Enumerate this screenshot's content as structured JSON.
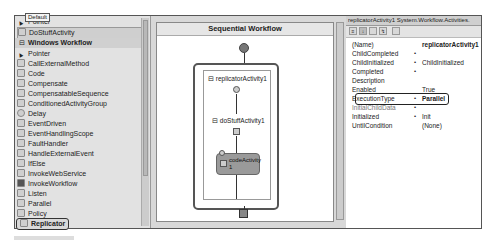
{
  "toolbox": {
    "tooltip": "Default",
    "top_items": [
      {
        "label": "Pointer",
        "icon": "pointer-arrow-icon"
      },
      {
        "label": "DoStuffActivity",
        "icon": "activity-gear-icon",
        "selected": true
      }
    ],
    "section_header": "Windows Workflow",
    "items": [
      {
        "label": "Pointer",
        "icon": "pointer-arrow-icon"
      },
      {
        "label": "CallExternalMethod",
        "icon": "call-external-method-icon"
      },
      {
        "label": "Code",
        "icon": "code-icon"
      },
      {
        "label": "Compensate",
        "icon": "compensate-icon"
      },
      {
        "label": "CompensatableSequence",
        "icon": "compensatable-sequence-icon"
      },
      {
        "label": "ConditionedActivityGroup",
        "icon": "conditioned-activity-group-icon"
      },
      {
        "label": "Delay",
        "icon": "delay-clock-icon"
      },
      {
        "label": "EventDriven",
        "icon": "event-driven-icon"
      },
      {
        "label": "EventHandlingScope",
        "icon": "event-handling-scope-icon"
      },
      {
        "label": "FaultHandler",
        "icon": "fault-handler-icon"
      },
      {
        "label": "HandleExternalEvent",
        "icon": "handle-external-event-icon"
      },
      {
        "label": "IfElse",
        "icon": "ifelse-icon"
      },
      {
        "label": "InvokeWebService",
        "icon": "invoke-web-service-icon"
      },
      {
        "label": "InvokeWorkflow",
        "icon": "invoke-workflow-icon"
      },
      {
        "label": "Listen",
        "icon": "listen-icon"
      },
      {
        "label": "Parallel",
        "icon": "parallel-icon"
      },
      {
        "label": "Policy",
        "icon": "policy-icon"
      },
      {
        "label": "Replicator",
        "icon": "replicator-icon",
        "highlighted": true
      }
    ]
  },
  "designer": {
    "title": "Sequential Workflow",
    "replicator_label": "replicatorActivity1",
    "dostuff_label": "doStuffActivity1",
    "code_label_line1": "codeActivity",
    "code_label_line2": "1",
    "expand_glyph": "⊟"
  },
  "properties": {
    "header": "replicatorActivity1 System.Workflow.Activities.",
    "toolbar": [
      "categorized",
      "alphabetical",
      "properties",
      "events",
      "property-pages"
    ],
    "rows": [
      {
        "key": "(Name)",
        "value": "replicatorActivity1",
        "bold_value": true
      },
      {
        "key": "ChildCompleted",
        "dot": "•",
        "value": ""
      },
      {
        "key": "ChildInitialized",
        "dot": "•",
        "value": "ChildInitialized"
      },
      {
        "key": "Completed",
        "dot": "•",
        "value": ""
      },
      {
        "key": "Description",
        "value": ""
      },
      {
        "key": "Enabled",
        "value": "True"
      },
      {
        "key": "ExecutionType",
        "dot": "•",
        "value": "Parallel",
        "bold_value": true,
        "highlighted": true
      },
      {
        "key": "InitialChildData",
        "dot": "•",
        "value": ""
      },
      {
        "key": "Initialized",
        "dot": "•",
        "value": "Init"
      },
      {
        "key": "UntilCondition",
        "value": "(None)"
      }
    ]
  }
}
